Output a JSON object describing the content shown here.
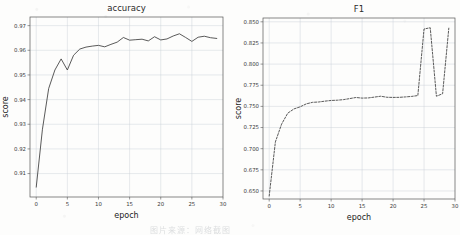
{
  "figure": {
    "background": "#fdfdfc",
    "line_color": "#3c3c3c",
    "grid_color": "#c9cfd6",
    "caption": "图片来源：网络截图"
  },
  "chart_data": [
    {
      "type": "line",
      "title": "accuracy",
      "xlabel": "epoch",
      "ylabel": "score",
      "xlim": [
        -1,
        30
      ],
      "ylim": [
        0.9005,
        0.9735
      ],
      "xticks": [
        0,
        5,
        10,
        15,
        20,
        25,
        30
      ],
      "xticklabels": [
        "0",
        "5",
        "10",
        "15",
        "20",
        "25",
        "30"
      ],
      "yticks": [
        0.91,
        0.92,
        0.93,
        0.94,
        0.95,
        0.96,
        0.97
      ],
      "yticklabels": [
        "0.91",
        "0.92",
        "0.93",
        "0.94",
        "0.95",
        "0.96",
        "0.97"
      ],
      "grid": true,
      "legend": null,
      "linestyle": "solid",
      "x": [
        0,
        1,
        2,
        3,
        4,
        5,
        6,
        7,
        8,
        9,
        10,
        11,
        12,
        13,
        14,
        15,
        16,
        17,
        18,
        19,
        20,
        21,
        22,
        23,
        24,
        25,
        26,
        27,
        28,
        29
      ],
      "y": [
        0.9045,
        0.928,
        0.9445,
        0.952,
        0.9565,
        0.952,
        0.958,
        0.9605,
        0.9613,
        0.9617,
        0.962,
        0.9614,
        0.9624,
        0.9633,
        0.9652,
        0.9641,
        0.9643,
        0.9645,
        0.9638,
        0.9655,
        0.9642,
        0.9646,
        0.9658,
        0.9667,
        0.9652,
        0.9636,
        0.9653,
        0.9657,
        0.9651,
        0.9648
      ]
    },
    {
      "type": "line",
      "title": "F1",
      "xlabel": "epoch",
      "ylabel": "score",
      "xlim": [
        -1,
        30
      ],
      "ylim": [
        0.6405,
        0.8545
      ],
      "xticks": [
        0,
        5,
        10,
        15,
        20,
        25,
        30
      ],
      "xticklabels": [
        "0",
        "5",
        "10",
        "15",
        "20",
        "25",
        "30"
      ],
      "yticks": [
        0.65,
        0.675,
        0.7,
        0.725,
        0.75,
        0.775,
        0.8,
        0.825,
        0.85
      ],
      "yticklabels": [
        "0.650",
        "0.675",
        "0.700",
        "0.725",
        "0.750",
        "0.775",
        "0.800",
        "0.825",
        "0.850"
      ],
      "grid": true,
      "legend": null,
      "linestyle": "dashed",
      "x": [
        0,
        1,
        2,
        3,
        4,
        5,
        6,
        7,
        8,
        9,
        10,
        11,
        12,
        13,
        14,
        15,
        16,
        17,
        18,
        19,
        20,
        21,
        22,
        23,
        24,
        25,
        26,
        27,
        28,
        29
      ],
      "y": [
        0.644,
        0.708,
        0.729,
        0.742,
        0.747,
        0.7495,
        0.753,
        0.7548,
        0.7552,
        0.7562,
        0.757,
        0.7573,
        0.758,
        0.7592,
        0.7605,
        0.7598,
        0.76,
        0.761,
        0.762,
        0.7608,
        0.7606,
        0.7607,
        0.7612,
        0.7618,
        0.7628,
        0.8415,
        0.843,
        0.762,
        0.765,
        0.8425
      ]
    }
  ]
}
